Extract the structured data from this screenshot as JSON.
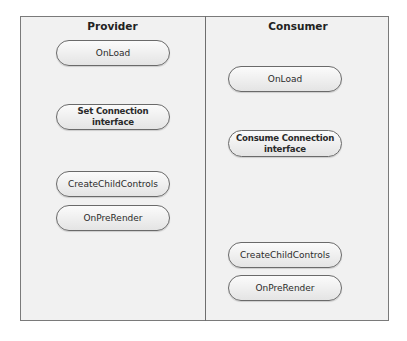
{
  "diagram": {
    "columns": [
      {
        "title": "Provider",
        "steps": [
          {
            "label": "OnLoad",
            "bold": false
          },
          {
            "label": "Set Connection interface",
            "bold": true
          },
          {
            "label": "CreateChildControls",
            "bold": false
          },
          {
            "label": "OnPreRender",
            "bold": false
          }
        ]
      },
      {
        "title": "Consumer",
        "steps": [
          {
            "label": "OnLoad",
            "bold": false
          },
          {
            "label": "Consume Connection interface",
            "bold": true
          },
          {
            "label": "CreateChildControls",
            "bold": false
          },
          {
            "label": "OnPreRender",
            "bold": false
          }
        ]
      }
    ]
  }
}
